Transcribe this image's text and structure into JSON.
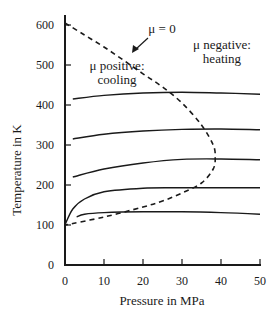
{
  "chart_data": {
    "type": "line",
    "title": "",
    "xlabel": "Pressure in MPa",
    "ylabel": "Temperature in K",
    "xlim": [
      0,
      50
    ],
    "ylim": [
      0,
      620
    ],
    "xticks": [
      0,
      10,
      20,
      30,
      40,
      50
    ],
    "yticks": [
      0,
      100,
      200,
      300,
      400,
      500,
      600
    ],
    "grid": false,
    "legend": "none",
    "series": [
      {
        "name": "isenthalp 1",
        "style": "solid",
        "x": [
          2,
          10,
          20,
          30,
          40,
          50
        ],
        "y": [
          415,
          424,
          430,
          432,
          430,
          427
        ]
      },
      {
        "name": "isenthalp 2",
        "style": "solid",
        "x": [
          2,
          10,
          20,
          30,
          40,
          50
        ],
        "y": [
          315,
          327,
          335,
          339,
          340,
          338
        ]
      },
      {
        "name": "isenthalp 3",
        "style": "solid",
        "x": [
          2,
          10,
          20,
          30,
          40,
          50
        ],
        "y": [
          220,
          240,
          255,
          264,
          265,
          263
        ]
      },
      {
        "name": "isenthalp 4",
        "style": "solid",
        "x": [
          0,
          2,
          5,
          10,
          20,
          30,
          40,
          50
        ],
        "y": [
          100,
          140,
          165,
          183,
          192,
          193,
          193,
          193
        ]
      },
      {
        "name": "isenthalp 5",
        "style": "solid",
        "x": [
          3,
          5,
          10,
          20,
          30,
          40,
          50
        ],
        "y": [
          120,
          127,
          131,
          133,
          133,
          131,
          127
        ]
      },
      {
        "name": "inversion curve (μ = 0)",
        "style": "dashed",
        "x": [
          0,
          5,
          10,
          15,
          20,
          25,
          30,
          35,
          38,
          38.5,
          38,
          35,
          30,
          25,
          20,
          10,
          0
        ],
        "y": [
          605,
          575,
          545,
          512,
          478,
          445,
          405,
          350,
          300,
          270,
          240,
          205,
          180,
          160,
          145,
          120,
          100
        ]
      }
    ],
    "annotations": [
      {
        "text": "μ = 0",
        "x": 25,
        "y": 585,
        "arrow_to": [
          17,
          555
        ]
      },
      {
        "text": "μ positive:",
        "x": 13,
        "y": 502
      },
      {
        "text": "cooling",
        "x": 13,
        "y": 467
      },
      {
        "text": "μ negative:",
        "x": 40,
        "y": 555
      },
      {
        "text": "heating",
        "x": 40,
        "y": 522
      }
    ]
  },
  "labels": {
    "xlabel": "Pressure in MPa",
    "ylabel": "Temperature in K",
    "xticks": [
      "0",
      "10",
      "20",
      "30",
      "40",
      "50"
    ],
    "yticks": [
      "0",
      "100",
      "200",
      "300",
      "400",
      "500",
      "600"
    ],
    "mu_zero": "μ = 0",
    "positive_line1": "μ positive:",
    "positive_line2": "cooling",
    "negative_line1": "μ negative:",
    "negative_line2": "heating"
  }
}
